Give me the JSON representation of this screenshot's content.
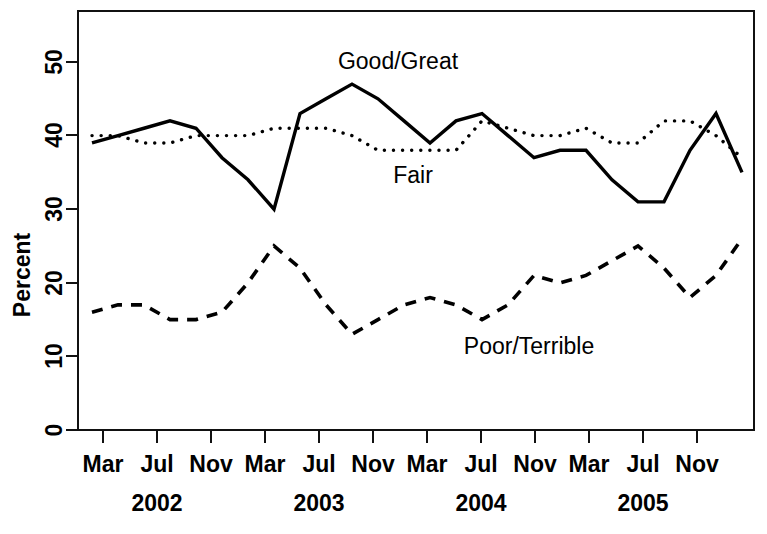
{
  "chart_data": {
    "type": "line",
    "title": "",
    "xlabel": "",
    "ylabel": "Percent",
    "ylim": [
      0,
      55
    ],
    "yticks": [
      0,
      10,
      20,
      30,
      40,
      50
    ],
    "grid": false,
    "legend_position": "inline-annotations",
    "x_tick_labels": [
      "Mar",
      "Jul",
      "Nov",
      "Mar",
      "Jul",
      "Nov",
      "Mar",
      "Jul",
      "Nov",
      "Mar",
      "Jul",
      "Nov"
    ],
    "x_group_labels": [
      "2002",
      "2003",
      "2004",
      "2005"
    ],
    "x": [
      "2002-03",
      "2002-05",
      "2002-07",
      "2002-09",
      "2002-11",
      "2003-01",
      "2003-03",
      "2003-05",
      "2003-07",
      "2003-09",
      "2003-11",
      "2004-01",
      "2004-03",
      "2004-05",
      "2004-07",
      "2004-08",
      "2004-09",
      "2004-11",
      "2005-01",
      "2005-03",
      "2005-05",
      "2005-06",
      "2005-07",
      "2005-09",
      "2005-11",
      "2005-12"
    ],
    "series": [
      {
        "name": "Good/Great",
        "style": "solid",
        "values": [
          39,
          40,
          41,
          42,
          41,
          37,
          34,
          30,
          43,
          45,
          47,
          45,
          42,
          39,
          42,
          43,
          40,
          37,
          38,
          38,
          34,
          31,
          31,
          38,
          43,
          35
        ]
      },
      {
        "name": "Fair",
        "style": "dotted",
        "values": [
          40,
          40,
          39,
          39,
          40,
          40,
          40,
          41,
          41,
          41,
          40,
          38,
          38,
          38,
          38,
          42,
          41,
          40,
          40,
          41,
          39,
          39,
          42,
          42,
          40,
          37
        ]
      },
      {
        "name": "Poor/Terrible",
        "style": "dashed",
        "values": [
          16,
          17,
          17,
          15,
          15,
          16,
          20,
          25,
          22,
          17,
          13,
          15,
          17,
          18,
          17,
          15,
          17,
          21,
          20,
          21,
          23,
          25,
          22,
          18,
          21,
          26
        ]
      }
    ],
    "annotations": [
      {
        "text": "Good/Great",
        "x_px": 398,
        "y_px": 69
      },
      {
        "text": "Fair",
        "x_px": 413,
        "y_px": 183
      },
      {
        "text": "Poor/Terrible",
        "x_px": 529,
        "y_px": 354
      }
    ]
  },
  "axes": {
    "y_title": "Percent",
    "y_tick_text": [
      "0",
      "10",
      "20",
      "30",
      "40",
      "50"
    ],
    "x_tick_text": [
      "Mar",
      "Jul",
      "Nov",
      "Mar",
      "Jul",
      "Nov",
      "Mar",
      "Jul",
      "Nov",
      "Mar",
      "Jul",
      "Nov"
    ],
    "year_text": [
      "2002",
      "2003",
      "2004",
      "2005"
    ]
  }
}
